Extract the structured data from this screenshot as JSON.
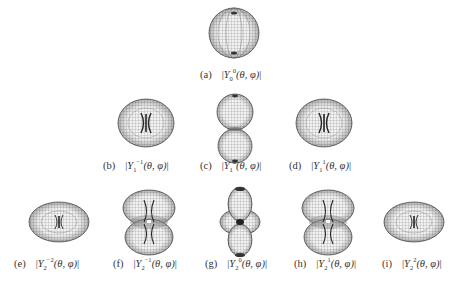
{
  "figure": {
    "panels": [
      {
        "id": "a",
        "tag": "(a)",
        "l": "0",
        "m": "0",
        "shape": "sphere"
      },
      {
        "id": "b",
        "tag": "(b)",
        "l": "1",
        "m": "−1",
        "shape": "torus"
      },
      {
        "id": "c",
        "tag": "(c)",
        "l": "1",
        "m": "0",
        "shape": "dumbbell"
      },
      {
        "id": "d",
        "tag": "(d)",
        "l": "1",
        "m": "1",
        "shape": "torus"
      },
      {
        "id": "e",
        "tag": "(e)",
        "l": "2",
        "m": "−2",
        "shape": "flat-torus"
      },
      {
        "id": "f",
        "tag": "(f)",
        "l": "2",
        "m": "−1",
        "shape": "double-torus"
      },
      {
        "id": "g",
        "tag": "(g)",
        "l": "2",
        "m": "0",
        "shape": "dumbbell-with-ring"
      },
      {
        "id": "h",
        "tag": "(h)",
        "l": "2",
        "m": "1",
        "shape": "double-torus"
      },
      {
        "id": "i",
        "tag": "(i)",
        "l": "2",
        "m": "2",
        "shape": "flat-torus"
      }
    ],
    "symbol": "Y",
    "args": "(θ, φ)",
    "bar": "|",
    "colors": {
      "mesh": "#555555",
      "mesh_light": "#9a9a9a",
      "fill": "#e8e8e8",
      "dark": "#222222"
    }
  }
}
